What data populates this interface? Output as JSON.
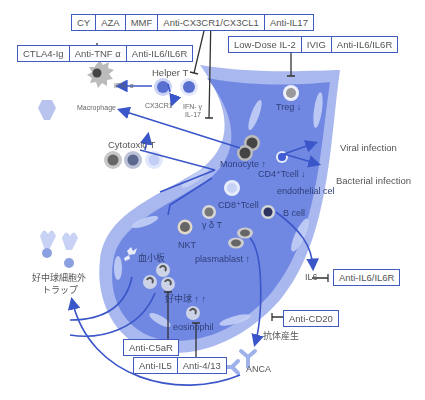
{
  "drug_boxes": {
    "top": [
      "CY",
      "AZA",
      "MMF",
      "Anti-CX3CR1/CX3CL1",
      "Anti-IL17"
    ],
    "left": [
      "CTLA4-Ig",
      "Anti-TNF α",
      "Anti-IL6/IL6R"
    ],
    "right": [
      "Low-Dose IL-2",
      "IVIG",
      "Anti-IL6/IL6R"
    ],
    "il6": [
      "Anti-IL6/IL6R"
    ],
    "cd20": [
      "Anti-CD20"
    ],
    "c5ar": [
      "Anti-C5aR"
    ],
    "bottom": [
      "Anti-IL5",
      "Anti-4/13"
    ]
  },
  "labels": {
    "helper_t": "Helper T",
    "ifn_alpha": "IFN- α",
    "cx3cr1": "CX3CR1",
    "ifn_gamma": "IFN- γ",
    "il17": "IL-17",
    "macrophage": "Macrophage",
    "cytotoxic_t": "Cytotoxic T",
    "treg": "Treg ↓",
    "monocyte": "Monocyte ↑",
    "cd4_tcell": "CD4⁺Tcell ↓",
    "viral_infection": "Viral infection",
    "bacterial_infection": "Bacterial infection",
    "endothelial_cell": "endothelial cel",
    "cd8_tcell": "CD8⁺Tcell",
    "b_cell": "B cell",
    "gamma_delta_t": "γ δ T",
    "nkt": "NKT",
    "plasmablast": "plasmablast ↑",
    "platelet": "血小板",
    "net_line1": "好中球細胞外",
    "net_line2": "トラップ",
    "neutrophil": "好中球 ↑ ↑",
    "eosinophil": "eosinophil",
    "il6": "IL6",
    "antibody_production": "抗体産生",
    "anca": "ANCA"
  },
  "colors": {
    "box_border": "#3f5bbf",
    "arrow": "#3a56c8",
    "vessel_outer": "#a9b8ee",
    "vessel_inner": "#6f86e0",
    "vessel_wall": "#c5d0f5",
    "inhibit_line": "#333333"
  }
}
